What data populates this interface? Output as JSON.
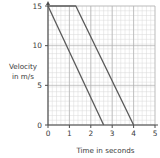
{
  "chart_data": {
    "type": "line",
    "title": "",
    "xlabel": "Time in seconds",
    "ylabel": "Velocity in m/s",
    "ylabel_line1": "Velocity",
    "ylabel_line2": "in m/s",
    "xlim": [
      0,
      5
    ],
    "ylim": [
      0,
      15
    ],
    "xticks": [
      0,
      1,
      2,
      3,
      4,
      5
    ],
    "xtick_labels": [
      "0",
      "1",
      "2",
      "3",
      "4",
      "5"
    ],
    "yticks": [
      0,
      5,
      10,
      15
    ],
    "ytick_labels": [
      "0",
      "5",
      "10",
      "15"
    ],
    "grid": true,
    "grid_minor_step_x": 0.2,
    "grid_minor_step_y": 0.6,
    "grid_major_step_x": 1,
    "grid_major_step_y": 5,
    "legend": "none",
    "series": [
      {
        "name": "line-a",
        "points": [
          [
            0,
            15
          ],
          [
            2.6,
            0
          ]
        ]
      },
      {
        "name": "line-b",
        "points": [
          [
            0,
            15
          ],
          [
            1.3,
            15
          ],
          [
            4.0,
            0
          ]
        ]
      }
    ],
    "colors": {
      "line": "#595959",
      "axis": "#4d4d4d",
      "grid_minor": "#d9d9d9",
      "grid_major": "#b0b0b0",
      "background": "#ffffff",
      "text": "#3a3a3a"
    }
  }
}
